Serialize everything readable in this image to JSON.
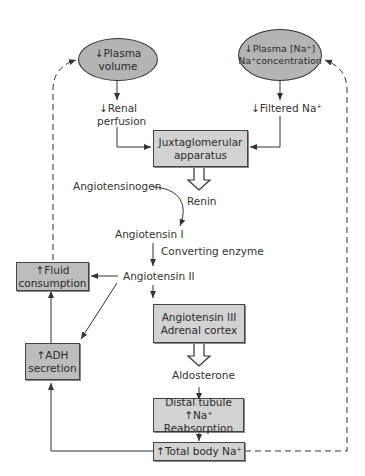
{
  "diagram": {
    "nodes": {
      "plasma_volume": {
        "line1": "↓Plasma",
        "line2": "volume"
      },
      "plasma_na": {
        "line1": "↓Plasma [Na⁺]",
        "line2": "Na⁺concentration"
      },
      "juxtaglomerular": {
        "line1": "Juxtaglomerular",
        "line2": "apparatus"
      },
      "fluid_consumption": {
        "line1": "↑Fluid",
        "line2": "consumption"
      },
      "adh_secretion": {
        "line1": "↑ADH",
        "line2": "secretion"
      },
      "angiotensin_iii": {
        "line1": "Angiotensin III",
        "line2": "Adrenal cortex"
      },
      "distal_tubule": {
        "line1": "Distal tubule",
        "line2": "↑Na⁺ Reabsorption"
      },
      "total_body_na": {
        "line1": "↑Total body Na⁺"
      }
    },
    "labels": {
      "renal_perfusion_1": "↓Renal",
      "renal_perfusion_2": "perfusion",
      "filtered_na": "↓Filtered Na⁺",
      "angiotensinogen": "Angiotensinogen",
      "renin": "Renin",
      "angiotensin_i": "Angiotensin I",
      "converting_enzyme": "Converting enzyme",
      "angiotensin_ii": "Angiotensin II",
      "aldosterone": "Aldosterone"
    },
    "colors": {
      "ellipse_fill": "#b4b4b4",
      "box_fill": "#d2d2d2",
      "box_dark_fill": "#bdbdbd",
      "line": "#333333"
    }
  }
}
